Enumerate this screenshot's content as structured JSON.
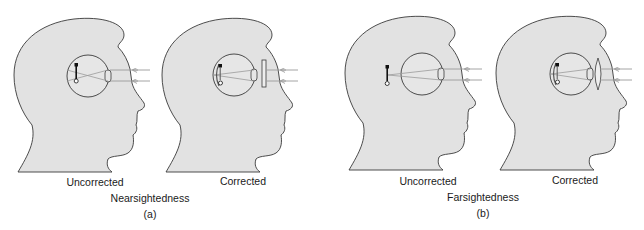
{
  "colors": {
    "head_fill": "#e2e2e2",
    "outline": "#3a3a3a",
    "ray": "#9a9a9a",
    "object": "#111111"
  },
  "panels": [
    {
      "id": "a",
      "condition": "Nearsightedness",
      "letter": "(a)",
      "views": [
        {
          "label": "Uncorrected",
          "corrective_lens": "none",
          "image_position": "in front of retina"
        },
        {
          "label": "Corrected",
          "corrective_lens": "concave (diverging)",
          "image_position": "on retina"
        }
      ]
    },
    {
      "id": "b",
      "condition": "Farsightedness",
      "letter": "(b)",
      "views": [
        {
          "label": "Uncorrected",
          "corrective_lens": "none",
          "image_position": "behind retina"
        },
        {
          "label": "Corrected",
          "corrective_lens": "convex (converging)",
          "image_position": "on retina"
        }
      ]
    }
  ]
}
